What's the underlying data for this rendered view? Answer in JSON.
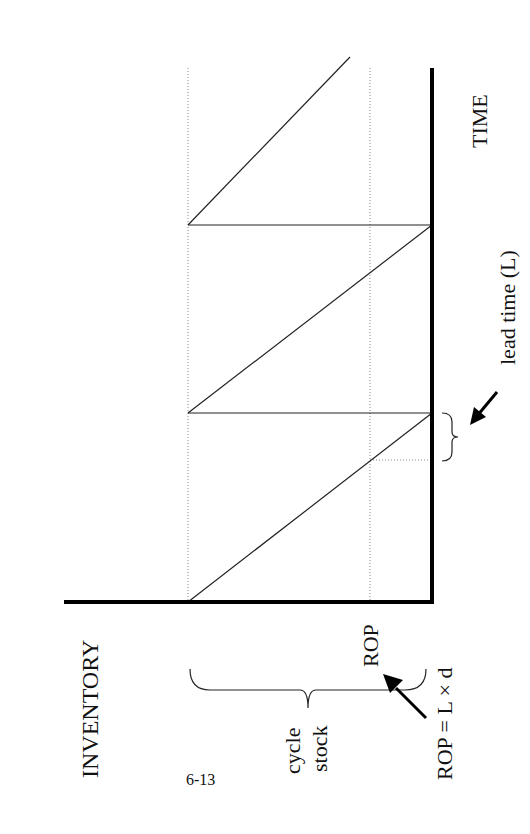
{
  "diagram": {
    "type": "inventory-sawtooth",
    "orientation": "rotated-90-clockwise",
    "labels": {
      "y_axis": "INVENTORY",
      "x_axis": "TIME",
      "rop": "ROP",
      "cycle_stock_line1": "cycle",
      "cycle_stock_line2": "stock",
      "rop_formula": "ROP = L × d",
      "lead_time": "lead time (L)",
      "page_number": "6-13"
    },
    "colors": {
      "line": "#111111",
      "dotted": "#888888",
      "background": "#ffffff"
    }
  }
}
